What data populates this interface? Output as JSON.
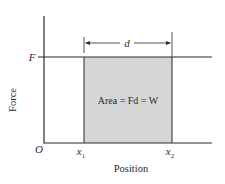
{
  "diagram": {
    "y_axis_label": "Force",
    "x_axis_label": "Position",
    "origin_label": "O",
    "force_level_label": "F",
    "x1_label": "x",
    "x1_sub": "1",
    "x2_label": "x",
    "x2_sub": "2",
    "distance_label": "d",
    "area_label": "Area = Fd = W",
    "colors": {
      "shaded_area": "#d6d6d6",
      "lines": "#2a2a2a",
      "background": "#ffffff"
    }
  }
}
